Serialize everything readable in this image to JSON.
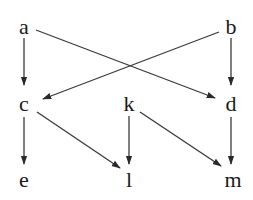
{
  "diagram": {
    "type": "directed-graph",
    "nodes": [
      {
        "id": "a",
        "label": "a",
        "x": 24,
        "y": 27
      },
      {
        "id": "b",
        "label": "b",
        "x": 231,
        "y": 27
      },
      {
        "id": "c",
        "label": "c",
        "x": 24,
        "y": 104
      },
      {
        "id": "k",
        "label": "k",
        "x": 129,
        "y": 104
      },
      {
        "id": "d",
        "label": "d",
        "x": 231,
        "y": 104
      },
      {
        "id": "e",
        "label": "e",
        "x": 24,
        "y": 180
      },
      {
        "id": "l",
        "label": "l",
        "x": 129,
        "y": 180
      },
      {
        "id": "m",
        "label": "m",
        "x": 233,
        "y": 180
      }
    ],
    "edges": [
      {
        "from": "a",
        "to": "c",
        "x1": 24,
        "y1": 38,
        "x2": 24,
        "y2": 85
      },
      {
        "from": "a",
        "to": "d",
        "x1": 36,
        "y1": 30,
        "x2": 215,
        "y2": 98
      },
      {
        "from": "b",
        "to": "c",
        "x1": 219,
        "y1": 32,
        "x2": 43,
        "y2": 99
      },
      {
        "from": "b",
        "to": "d",
        "x1": 231,
        "y1": 38,
        "x2": 231,
        "y2": 85
      },
      {
        "from": "c",
        "to": "e",
        "x1": 24,
        "y1": 117,
        "x2": 24,
        "y2": 164
      },
      {
        "from": "c",
        "to": "l",
        "x1": 37,
        "y1": 112,
        "x2": 120,
        "y2": 168
      },
      {
        "from": "k",
        "to": "l",
        "x1": 129,
        "y1": 116,
        "x2": 129,
        "y2": 164
      },
      {
        "from": "k",
        "to": "m",
        "x1": 140,
        "y1": 112,
        "x2": 221,
        "y2": 166
      },
      {
        "from": "d",
        "to": "m",
        "x1": 231,
        "y1": 117,
        "x2": 231,
        "y2": 164
      }
    ]
  }
}
